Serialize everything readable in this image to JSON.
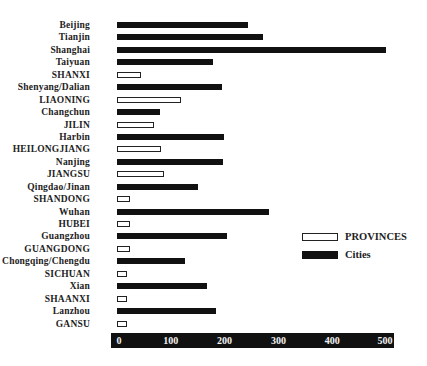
{
  "chart_data": {
    "type": "bar",
    "orientation": "horizontal",
    "title": "",
    "xlabel": "",
    "ylabel": "",
    "xlim": [
      0,
      500
    ],
    "x_ticks": [
      "0",
      "100",
      "200",
      "300",
      "400",
      "500"
    ],
    "grid": false,
    "legend_position": "right-middle",
    "legend": [
      {
        "name": "PROVINCES",
        "style": "outline",
        "color": "#ffffff",
        "border": "#222222"
      },
      {
        "name": "Cities",
        "style": "filled",
        "color": "#111111"
      }
    ],
    "categories": [
      "Beijing",
      "Tianjin",
      "Shanghai",
      "Taiyuan",
      "SHANXI",
      "Shenyang/Dalian",
      "LIAONING",
      "Changchun",
      "JILIN",
      "Harbin",
      "HEILONGJIANG",
      "Nanjing",
      "JIANGSU",
      "Qingdao/Jinan",
      "SHANDONG",
      "Wuhan",
      "HUBEI",
      "Guangzhou",
      "GUANGDONG",
      "Chongqing/Chengdu",
      "SICHUAN",
      "Xian",
      "SHAANXI",
      "Lanzhou",
      "GANSU"
    ],
    "rows": [
      {
        "label": "Beijing",
        "value": 243,
        "kind": "city"
      },
      {
        "label": "Tianjin",
        "value": 271,
        "kind": "city"
      },
      {
        "label": "Shanghai",
        "value": 500,
        "kind": "city"
      },
      {
        "label": "Taiyuan",
        "value": 178,
        "kind": "city"
      },
      {
        "label": "SHANXI",
        "value": 45,
        "kind": "province"
      },
      {
        "label": "Shenyang/Dalian",
        "value": 195,
        "kind": "city"
      },
      {
        "label": "LIAONING",
        "value": 119,
        "kind": "province"
      },
      {
        "label": "Changchun",
        "value": 80,
        "kind": "city"
      },
      {
        "label": "JILIN",
        "value": 69,
        "kind": "province"
      },
      {
        "label": "Harbin",
        "value": 199,
        "kind": "city"
      },
      {
        "label": "HEILONGJIANG",
        "value": 82,
        "kind": "province"
      },
      {
        "label": "Nanjing",
        "value": 197,
        "kind": "city"
      },
      {
        "label": "JIANGSU",
        "value": 88,
        "kind": "province"
      },
      {
        "label": "Qingdao/Jinan",
        "value": 151,
        "kind": "city"
      },
      {
        "label": "SHANDONG",
        "value": 24,
        "kind": "province"
      },
      {
        "label": "Wuhan",
        "value": 283,
        "kind": "city"
      },
      {
        "label": "HUBEI",
        "value": 24,
        "kind": "province"
      },
      {
        "label": "Guangzhou",
        "value": 205,
        "kind": "city"
      },
      {
        "label": "GUANGDONG",
        "value": 24,
        "kind": "province"
      },
      {
        "label": "Chongqing/Chengdu",
        "value": 127,
        "kind": "city"
      },
      {
        "label": "SICHUAN",
        "value": 19,
        "kind": "province"
      },
      {
        "label": "Xian",
        "value": 167,
        "kind": "city"
      },
      {
        "label": "SHAANXI",
        "value": 19,
        "kind": "province"
      },
      {
        "label": "Lanzhou",
        "value": 184,
        "kind": "city"
      },
      {
        "label": "GANSU",
        "value": 19,
        "kind": "province"
      }
    ],
    "series": [
      {
        "name": "Cities",
        "values": [
          243,
          271,
          500,
          178,
          null,
          195,
          null,
          80,
          null,
          199,
          null,
          197,
          null,
          151,
          null,
          283,
          null,
          205,
          null,
          127,
          null,
          167,
          null,
          184,
          null
        ]
      },
      {
        "name": "PROVINCES",
        "values": [
          null,
          null,
          null,
          null,
          45,
          null,
          119,
          null,
          69,
          null,
          82,
          null,
          88,
          null,
          24,
          null,
          24,
          null,
          24,
          null,
          19,
          null,
          19,
          null,
          19
        ]
      }
    ]
  },
  "colors": {
    "city_bar": "#111111",
    "province_bar_fill": "#ffffff",
    "province_bar_border": "#222222",
    "axis_bg": "#111111",
    "axis_text": "#f2f2f2"
  }
}
